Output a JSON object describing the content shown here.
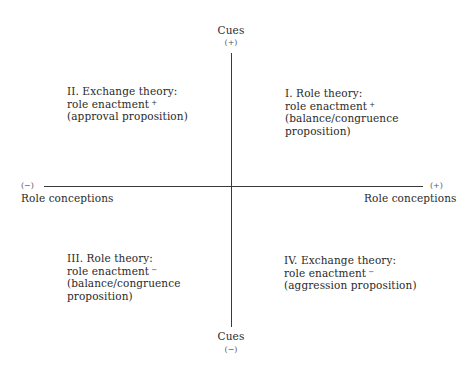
{
  "diagram": {
    "type": "quadrant",
    "vertical_axis": {
      "label_top": "Cues",
      "sign_top": "(+)",
      "label_bottom": "Cues",
      "sign_bottom": "(−)"
    },
    "horizontal_axis": {
      "label_left": "Role conceptions",
      "sign_left": "(−)",
      "label_right": "Role conceptions",
      "sign_right": "(+)"
    },
    "quadrants": {
      "top_left": {
        "line1": "II. Exchange theory:",
        "line2": "role enactment",
        "line2_sup": "+",
        "line3": "(approval proposition)"
      },
      "top_right": {
        "line1": "I. Role theory:",
        "line2": "role enactment",
        "line2_sup": "+",
        "line3": "(balance/congruence",
        "line4": "proposition)"
      },
      "bottom_left": {
        "line1": "III. Role theory:",
        "line2": "role enactment",
        "line2_sup": "−",
        "line3": "(balance/congruence",
        "line4": "proposition)"
      },
      "bottom_right": {
        "line1": "IV. Exchange theory:",
        "line2": "role enactment",
        "line2_sup": "−",
        "line3": "(aggression proposition)"
      }
    }
  }
}
